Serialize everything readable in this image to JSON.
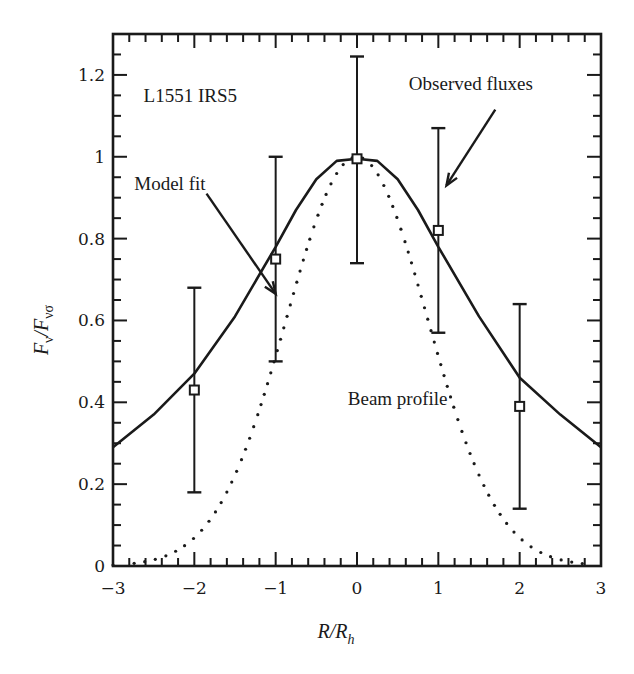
{
  "chart_data": {
    "type": "line",
    "title": "",
    "xlabel": "R/R_h",
    "ylabel": "F_ν/F_νσ",
    "xlim": [
      -3,
      3
    ],
    "ylim": [
      0,
      1.3
    ],
    "grid": false,
    "legend": null,
    "x_ticks": [
      -3,
      -2,
      -1,
      0,
      1,
      2,
      3
    ],
    "x_tick_labels": [
      "−3",
      "−2",
      "−1",
      "0",
      "1",
      "2",
      "3"
    ],
    "x_minor_step": 0.2,
    "y_ticks": [
      0,
      0.2,
      0.4,
      0.6,
      0.8,
      1,
      1.2
    ],
    "y_tick_labels": [
      "0",
      "0.2",
      "0.4",
      "0.6",
      "0.8",
      "1",
      "1.2"
    ],
    "y_minor_step": 0.05,
    "series": [
      {
        "name": "Model fit",
        "style": "solid",
        "x": [
          -3,
          -2.5,
          -2,
          -1.5,
          -1,
          -0.75,
          -0.5,
          -0.25,
          0,
          0.25,
          0.5,
          0.75,
          1,
          1.5,
          2,
          2.5,
          3
        ],
        "values": [
          0.29,
          0.37,
          0.47,
          0.61,
          0.78,
          0.87,
          0.945,
          0.99,
          0.995,
          0.99,
          0.945,
          0.87,
          0.78,
          0.61,
          0.46,
          0.37,
          0.29
        ]
      },
      {
        "name": "Beam profile",
        "style": "dotted",
        "function": "gaussian",
        "amplitude": 1.0,
        "sigma": 0.865,
        "x_range": [
          -3,
          3
        ]
      },
      {
        "name": "Observed fluxes",
        "style": "markers-errorbars",
        "marker": "square",
        "x": [
          -2,
          -1,
          0,
          1,
          2
        ],
        "values": [
          0.43,
          0.75,
          0.995,
          0.82,
          0.39
        ],
        "error_low": [
          0.18,
          0.5,
          0.74,
          0.57,
          0.14
        ],
        "error_high": [
          0.68,
          1.0,
          1.245,
          1.07,
          0.64
        ]
      }
    ],
    "annotations": [
      {
        "text": "L1551 IRS5",
        "x": -2.05,
        "y": 1.15
      },
      {
        "text": "Model fit",
        "x": -2.3,
        "y": 0.935,
        "arrow_from": [
          -1.85,
          0.91
        ],
        "arrow_to": [
          -1.0,
          0.665
        ]
      },
      {
        "text": "Observed fluxes",
        "x": 1.4,
        "y": 1.18,
        "arrow_from": [
          1.7,
          1.115
        ],
        "arrow_to": [
          1.1,
          0.93
        ]
      },
      {
        "text": "Beam profile",
        "x": 0.5,
        "y": 0.41
      }
    ]
  },
  "labels": {
    "source": "L1551 IRS5",
    "model_fit": "Model fit",
    "observed": "Observed fluxes",
    "beam": "Beam profile",
    "ylabel_main": "F",
    "ylabel_sub1": "ν",
    "ylabel_slash": "/F",
    "ylabel_sub2": "νσ",
    "xlabel_main": "R/R",
    "xlabel_sub": "h"
  },
  "colors": {
    "ink": "#1a1a1a",
    "background": "#ffffff"
  }
}
